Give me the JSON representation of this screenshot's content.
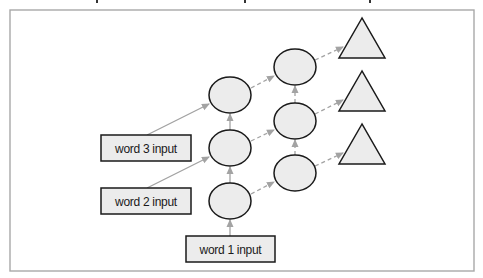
{
  "diagram": {
    "type": "stacked recurrent network (sequence-to-sequence)",
    "colors": {
      "frame": "#a8a8a8",
      "node_fill": "#ececec",
      "node_stroke": "#1a1a1a",
      "solid_arrow": "#a3a3a3",
      "dashed_arrow": "#a3a3a3"
    },
    "inputs": [
      {
        "id": "word3",
        "label": "word 3 input"
      },
      {
        "id": "word2",
        "label": "word 2 input"
      },
      {
        "id": "word1",
        "label": "word 1 input"
      }
    ],
    "layer1_nodes": 3,
    "layer2_nodes": 3,
    "output_nodes": 3,
    "edges": {
      "input_to_layer1": "solid",
      "layer1_vertical": "solid",
      "layer1_to_layer2": "dashed",
      "layer2_vertical": "dashed",
      "layer2_to_output": "dashed"
    }
  }
}
